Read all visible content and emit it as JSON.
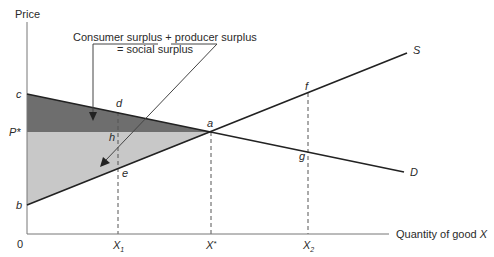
{
  "axes": {
    "y_label": "Price",
    "x_label_prefix": "Quantity of good ",
    "x_label_var": "X",
    "origin": "0"
  },
  "points": {
    "c": "c",
    "b": "b",
    "a": "a",
    "d": "d",
    "e": "e",
    "h": "h",
    "f": "f",
    "g": "g",
    "p_star": "P*"
  },
  "x_ticks": {
    "x1_base": "X",
    "x1_sub": "1",
    "xstar_base": "X",
    "xstar_sup": "*",
    "x2_base": "X",
    "x2_sub": "2"
  },
  "curves": {
    "supply": "S",
    "demand": "D"
  },
  "annotation": {
    "consumer": "Consumer surplus",
    "plus": " + ",
    "producer": "producer surplus",
    "equals": "= social surplus"
  },
  "colors": {
    "consumer_surplus_fill": "#6e6e6e",
    "producer_surplus_fill": "#c8c8c8",
    "line": "#222222",
    "dashed": "#555555"
  }
}
